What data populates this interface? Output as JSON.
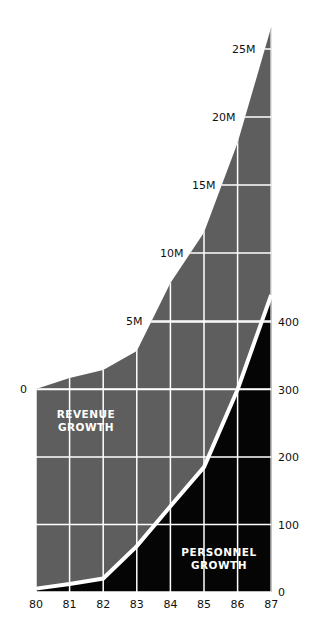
{
  "chart_data": {
    "type": "area",
    "title": "",
    "x": [
      "80",
      "81",
      "82",
      "83",
      "84",
      "85",
      "86",
      "87"
    ],
    "series": [
      {
        "name": "Revenue Growth",
        "label_lines": [
          "REVENUE",
          "GROWTH"
        ],
        "unit": "M",
        "values": [
          0,
          0.8,
          1.4,
          2.8,
          7.8,
          11.5,
          18.1,
          26.6
        ],
        "axis": "revenue",
        "color": "#5e5e5e"
      },
      {
        "name": "Personnel Growth",
        "label_lines": [
          "PERSONNEL",
          "GROWTH"
        ],
        "values": [
          5,
          12,
          20,
          68,
          127,
          185,
          300,
          440
        ],
        "axis": "personnel",
        "color": "#050505"
      }
    ],
    "revenue_axis": {
      "ticks": [
        0,
        5,
        10,
        15,
        20,
        25
      ],
      "tick_labels": [
        "0",
        "5M",
        "10M",
        "15M",
        "20M",
        "25M"
      ],
      "range": [
        0,
        26.6
      ]
    },
    "personnel_axis": {
      "ticks": [
        0,
        100,
        200,
        300,
        400
      ],
      "tick_labels": [
        "0",
        "100",
        "200",
        "300",
        "400"
      ],
      "range": [
        0,
        440
      ],
      "position": "right"
    },
    "xlabel": "",
    "grid": true,
    "legend": "inline labels"
  },
  "colors": {
    "revenue_fill": "#5e5e5e",
    "personnel_fill": "#050505",
    "grid": "#ffffff",
    "divider_line": "#ffffff",
    "text": "#111111"
  }
}
